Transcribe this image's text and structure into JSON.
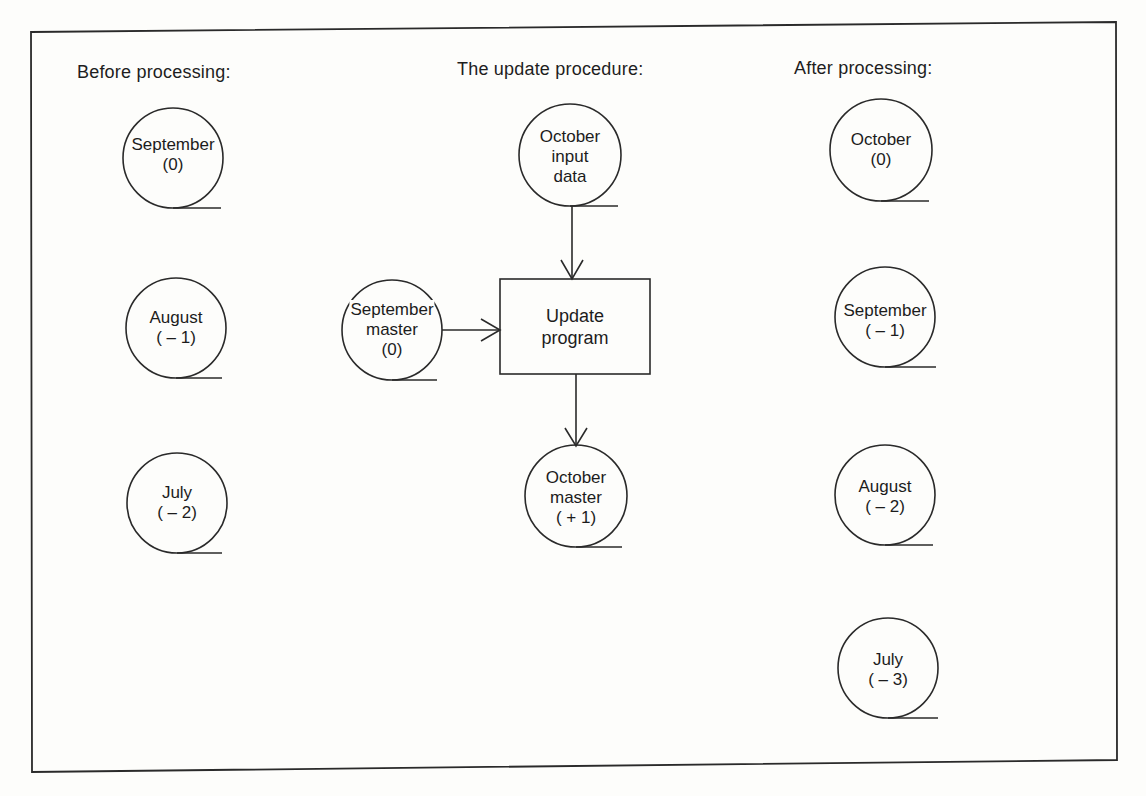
{
  "diagram": {
    "type": "generation-data-set update (grandfather-father-son) flow",
    "headings": {
      "before": "Before processing:",
      "procedure": "The update procedure:",
      "after": "After processing:"
    },
    "before": [
      {
        "line1": "September",
        "line2": "(0)"
      },
      {
        "line1": "August",
        "line2": "( – 1)"
      },
      {
        "line1": "July",
        "line2": "( – 2)"
      }
    ],
    "procedure": {
      "input": {
        "line1": "October",
        "line2": "input",
        "line3": "data"
      },
      "master_in": {
        "line1": "September",
        "line2": "master",
        "line3": "(0)"
      },
      "program": {
        "line1": "Update",
        "line2": "program"
      },
      "master_out": {
        "line1": "October",
        "line2": "master",
        "line3": "( + 1)"
      }
    },
    "after": [
      {
        "line1": "October",
        "line2": "(0)"
      },
      {
        "line1": "September",
        "line2": "( – 1)"
      },
      {
        "line1": "August",
        "line2": "( – 2)"
      },
      {
        "line1": "July",
        "line2": "( – 3)"
      }
    ],
    "edges": [
      {
        "from": "October input data",
        "to": "Update program"
      },
      {
        "from": "September master (0)",
        "to": "Update program"
      },
      {
        "from": "Update program",
        "to": "October master (+1)"
      }
    ],
    "colors": {
      "ink": "#1c1c1c",
      "paper": "#fdfdfb"
    }
  }
}
